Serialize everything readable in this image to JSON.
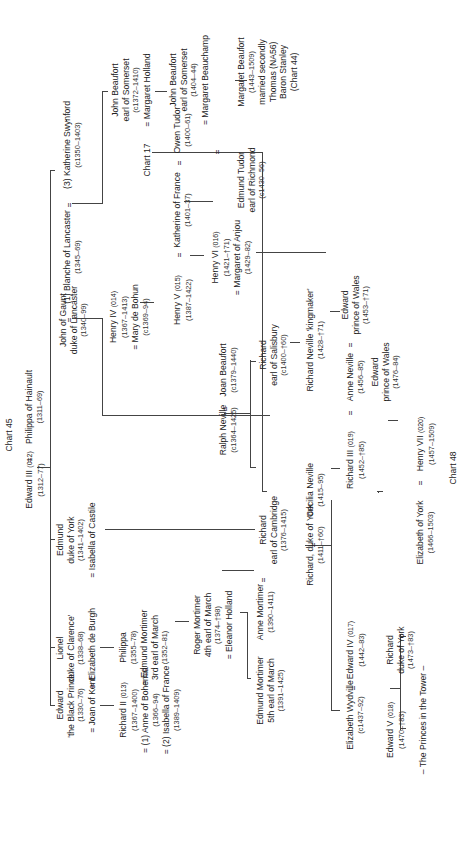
{
  "chart_refs": {
    "top": "Chart 45",
    "chart17": "Chart 17",
    "bottom": "Chart 48"
  },
  "people": {
    "edward3": {
      "name": "Edward III",
      "code": "(012)",
      "dates": "(1312–77)"
    },
    "philippa_hainault": {
      "name": "Philippa of Hainault",
      "dates": "(1311–69)"
    },
    "black_prince": {
      "line1": "Edward",
      "line2": "'the Black Prince'",
      "dates": "(1330–76)",
      "spouse": "= Joan of Kent"
    },
    "lionel": {
      "line1": "Lionel",
      "line2": "duke of Clarence'",
      "dates": "(1338–68)",
      "spouse": "= Elizabeth de Burgh"
    },
    "edmund_york": {
      "line1": "Edmund",
      "line2": "duke of York",
      "dates": "(1341–1402)",
      "spouse": "= Isabella of Castile"
    },
    "john_gaunt": {
      "line1": "John of Gaunt",
      "line2": "duke of Lancaster",
      "dates": "(1340–99)"
    },
    "blanche": {
      "name": "(1) Blanche of Lancaster",
      "dates": "(1345–69)"
    },
    "katherine_swynford": {
      "name": "(3) Katherine Swynford",
      "dates": "(c1350–1403)"
    },
    "richard2": {
      "name": "Richard II",
      "code": "(013)",
      "dates": "(1367–1400)",
      "spouse1": "= (1) Anne of Bohemia",
      "spouse1_dates": "(1366–94)",
      "spouse2": "= (2) Isabella of France",
      "spouse2_dates": "(1389–1409)"
    },
    "philippa": {
      "name": "Philippa",
      "dates": "(1355–78)",
      "spouse": "= Edmund Mortimer",
      "spouse_title": "3rd earl of March",
      "spouse_dates": "(1352–81)"
    },
    "roger_mortimer": {
      "line1": "Roger Mortimer",
      "line2": "4th earl of March",
      "dates": "(1374–†98)",
      "spouse": "= Eleanor Holland"
    },
    "edmund_mortimer5": {
      "line1": "Edmund Mortimer",
      "line2": "5th earl of March",
      "dates": "(1391–1425)"
    },
    "anne_mortimer": {
      "name": "Anne Mortimer",
      "dates": "(1390–1411)"
    },
    "richard_cambridge": {
      "line1": "Richard",
      "line2": "earl of Cambridge",
      "dates": "(1376–1415)"
    },
    "richard_york": {
      "name": "Richard, duke of York",
      "dates": "(1411–†60)"
    },
    "cecilia_neville": {
      "name": "Cecilia Neville",
      "dates": "(1415–95)"
    },
    "ralph_neville": {
      "name": "Ralph Neville",
      "dates": "(c1364–1425)"
    },
    "joan_beaufort": {
      "name": "Joan Beaufort",
      "dates": "(c1379–1440)"
    },
    "richard_salisbury": {
      "line1": "Richard",
      "line2": "earl of Salisbury",
      "dates": "(c1400–†60)"
    },
    "kingmaker": {
      "name": "Richard Neville 'kingmaker'",
      "dates": "(1428–†71)"
    },
    "henry4": {
      "name": "Henry IV",
      "code": "(014)",
      "dates": "(1367–1413)",
      "spouse": "= Mary de Bohun",
      "spouse_dates": "(c1369–94)"
    },
    "henry5": {
      "name": "Henry V",
      "code": "(015)",
      "dates": "(1387–1422)"
    },
    "katherine_france": {
      "name": "Katherine of France",
      "dates": "(1401–37)"
    },
    "owen_tudor": {
      "name": "Owen Tudor",
      "dates": "(1400–61)"
    },
    "henry6": {
      "name": "Henry VI",
      "code": "(016)",
      "dates": "(1421–†71)",
      "spouse": "= Margaret of Anjou",
      "spouse_dates": "(1429–82)"
    },
    "edmund_tudor": {
      "line1": "Edmund Tudor",
      "line2": "earl of Richmond",
      "dates": "(c1430–56)"
    },
    "john_beaufort1": {
      "line1": "John Beaufort",
      "line2": "earl of Somerset",
      "dates": "(c1372–1410)",
      "spouse": "= Margaret Holland"
    },
    "john_beaufort2": {
      "line1": "John Beaufort",
      "line2": "earl of Somerset",
      "dates": "(1404–44)",
      "spouse": "= Margaret Beauchamp"
    },
    "margaret_beaufort": {
      "line1": "Margaret Beaufort",
      "dates": "(1443–1509)",
      "line2": "married secondly",
      "line3": "Thomas (NA56)",
      "line4": "Baron Stanley",
      "line5": "(Chart 44)"
    },
    "edward4": {
      "name": "Edward IV",
      "code": "(017)",
      "dates": "(1442–83)"
    },
    "elizabeth_wydville": {
      "name": "Elizabeth Wydville",
      "dates": "(c1437–92)"
    },
    "richard3": {
      "name": "Richard III",
      "code": "(019)",
      "dates": "(1452–†85)"
    },
    "anne_neville": {
      "name": "Anne Neville",
      "dates": "(1456–85)"
    },
    "edward_pow1": {
      "line1": "Edward",
      "line2": "prince of Wales",
      "dates": "(1453–†71)"
    },
    "edward_pow2": {
      "line1": "Edward",
      "line2": "prince of Wales",
      "dates": "(1476–84)"
    },
    "edward5": {
      "name": "Edward V",
      "code": "(018)",
      "dates": "(1470–†83)"
    },
    "richard_york2": {
      "line1": "Richard",
      "line2": "duke of York",
      "dates": "(1473–†83)"
    },
    "princes": {
      "label": "– The Princes in the Tower –"
    },
    "elizabeth_york": {
      "name": "Elizabeth of York",
      "dates": "(1466–1503)"
    },
    "henry7": {
      "name": "Henry VII",
      "code": "(020)",
      "dates": "(1457–1509)"
    }
  },
  "symbols": {
    "eq": "="
  }
}
